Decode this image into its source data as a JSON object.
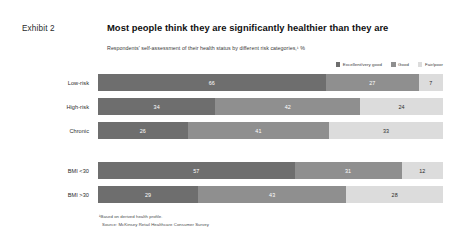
{
  "header": {
    "exhibit_label": "Exhibit 2",
    "title": "Most people think they are significantly healthier than they are",
    "subtitle": "Respondents' self-assessment of their health status by different risk categories,¹ %"
  },
  "footnotes": {
    "note1": "¹Based on derived health profile.",
    "source": "Source: McKinsey Retail Healthcare Consumer Survey"
  },
  "colors": {
    "series1": "#6e6e6e",
    "series2": "#8f8f8f",
    "series3": "#dcdcdc",
    "title": "#101010",
    "text": "#3a3a3a"
  },
  "chart_data": {
    "type": "bar",
    "orientation": "horizontal",
    "stacked": true,
    "title": "Most people think they are significantly healthier than they are",
    "subtitle": "Respondents' self-assessment of their health status by different risk categories,¹ %",
    "xlabel": "",
    "ylabel": "",
    "xlim": [
      0,
      100
    ],
    "grid": false,
    "legend_position": "top-right",
    "categories": [
      "Low-risk",
      "High-risk",
      "Chronic",
      "BMI <30",
      "BMI >30"
    ],
    "group_breaks": [
      3
    ],
    "series": [
      {
        "name": "Excellent/very good",
        "color": "#6e6e6e",
        "values": [
          66,
          34,
          26,
          57,
          29
        ]
      },
      {
        "name": "Good",
        "color": "#8f8f8f",
        "values": [
          27,
          42,
          41,
          31,
          43
        ]
      },
      {
        "name": "Fair/poor",
        "color": "#dcdcdc",
        "values": [
          7,
          24,
          33,
          12,
          28
        ]
      }
    ],
    "rows": [
      {
        "label": "Low-risk",
        "values": [
          66,
          27,
          7
        ]
      },
      {
        "label": "High-risk",
        "values": [
          34,
          42,
          24
        ]
      },
      {
        "label": "Chronic",
        "values": [
          26,
          41,
          33
        ]
      },
      {
        "label": "BMI <30",
        "values": [
          57,
          31,
          12
        ]
      },
      {
        "label": "BMI >30",
        "values": [
          29,
          43,
          28
        ]
      }
    ]
  }
}
